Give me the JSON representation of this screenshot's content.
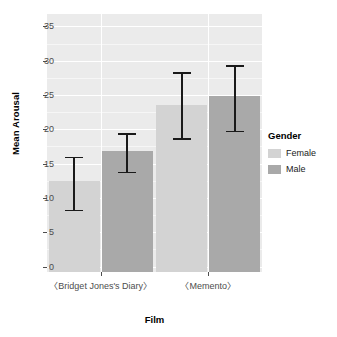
{
  "chart_data": {
    "type": "bar",
    "title": "",
    "subtitle": "",
    "xlabel": "Film",
    "ylabel": "Mean Arousal",
    "categories": [
      "〈Bridget Jones's Diary〉",
      "〈Memento〉"
    ],
    "series": [
      {
        "name": "Female",
        "color": "#d3d3d3",
        "values": [
          12.4,
          23.6
        ],
        "error_upper": [
          16.0,
          28.3
        ],
        "error_lower": [
          8.3,
          18.7
        ]
      },
      {
        "name": "Male",
        "color": "#a9a9a9",
        "values": [
          16.8,
          24.9
        ],
        "error_upper": [
          19.4,
          29.3
        ],
        "error_lower": [
          13.8,
          19.8
        ]
      }
    ],
    "ylim": [
      -0.8,
      36.8
    ],
    "yticks": [
      0,
      5,
      10,
      15,
      20,
      25,
      30,
      35
    ],
    "ytick_labels": [
      "0",
      "5",
      "10",
      "15",
      "20",
      "25",
      "30",
      "35"
    ],
    "yminor": [
      2.5,
      7.5,
      12.5,
      17.5,
      22.5,
      27.5,
      32.5
    ],
    "grid": true,
    "legend": {
      "title": "Gender",
      "position": "right",
      "entries": [
        {
          "label": "Female",
          "color": "#d3d3d3"
        },
        {
          "label": "Male",
          "color": "#a9a9a9"
        }
      ]
    },
    "panel_background": "#ebebeb",
    "errorbar_color": "#1a1a1a"
  }
}
